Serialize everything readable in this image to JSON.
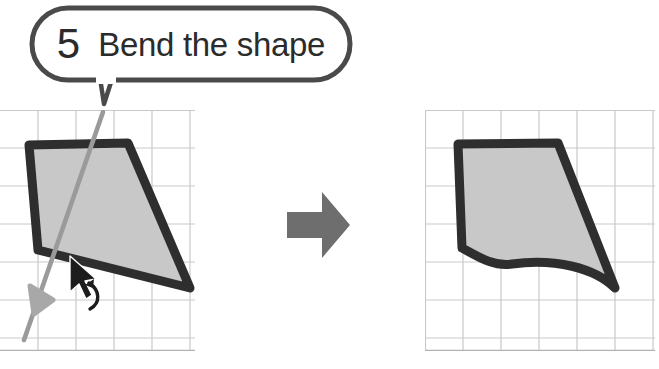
{
  "page": {
    "width": 659,
    "height": 369,
    "background": "#ffffff",
    "kind": "instructional-illustration"
  },
  "callout": {
    "step_number": "5",
    "label": "Bend the shape",
    "border_color": "#4a4a4a",
    "fill_color": "#ffffff",
    "text_color": "#2b2b2b",
    "has_pointer_tail": true
  },
  "leader": {
    "name": "pointer-line",
    "color": "#9a9a9a",
    "description": "gray arrow from callout tail down to the shape edge being dragged"
  },
  "panels": {
    "before": {
      "name": "before-panel",
      "grid_color": "#c9c9c9",
      "grid_cell": 38,
      "shape": {
        "name": "quadrilateral-straight",
        "fill": "#c8c8c8",
        "stroke": "#2e2e2e",
        "stroke_width": 9,
        "bottom_edge": "straight",
        "vertices": [
          [
            29,
            145
          ],
          [
            128,
            143
          ],
          [
            190,
            288
          ],
          [
            38,
            250
          ]
        ]
      },
      "cursor": {
        "name": "mouse-cursor",
        "x": 72,
        "y": 262,
        "color": "#1d1d1d"
      },
      "drag_hint": {
        "name": "drag-arc-arrow",
        "color": "#1d1d1d",
        "description": "small curved arrow indicating downward drag"
      }
    },
    "after": {
      "name": "after-panel",
      "grid_color": "#c9c9c9",
      "grid_cell": 38,
      "shape": {
        "name": "quadrilateral-bent",
        "fill": "#c8c8c8",
        "stroke": "#2e2e2e",
        "stroke_width": 9,
        "bottom_edge": "curved-concave",
        "vertices": [
          [
            458,
            144
          ],
          [
            558,
            143
          ],
          [
            615,
            288
          ],
          [
            462,
            248
          ]
        ]
      }
    }
  },
  "transition_arrow": {
    "name": "right-arrow",
    "color": "#6e6e6e",
    "direction": "right",
    "x": 287,
    "y": 192,
    "width": 63,
    "height": 66
  }
}
